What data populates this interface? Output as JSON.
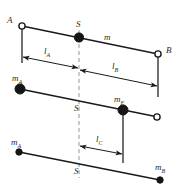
{
  "figure": {
    "width": 179,
    "height": 186,
    "background": "#ffffff",
    "line_color": "#1a1a1a",
    "centerline_color": "#8a8a8a",
    "node_fill_color": "#151515"
  },
  "bars": [
    {
      "id": "bar-top",
      "name": "original-rod",
      "left_label": "A",
      "right_label": "B",
      "center_label": "S",
      "mass_label": "m",
      "left_node": "open",
      "right_node": "open",
      "center_node": "filled"
    },
    {
      "id": "bar-middle",
      "name": "two-mass-equivalent-rod",
      "left_label": "m",
      "left_sub": "A",
      "right_label": "m",
      "right_sub": "E",
      "center_label": "S",
      "left_node": "filled",
      "right_node": "filled",
      "end_node": "open"
    },
    {
      "id": "bar-bottom",
      "name": "reduced-mass-rod",
      "left_label": "m",
      "left_sub": "A",
      "right_label": "m",
      "right_sub": "B",
      "center_label": "S",
      "left_node": "filled-small",
      "right_node": "filled-small"
    }
  ],
  "dimensions": [
    {
      "id": "dim-la",
      "name": "distance-a-to-s",
      "symbol": "l",
      "subscript": "A",
      "from": "A",
      "to": "S"
    },
    {
      "id": "dim-lb",
      "name": "distance-s-to-b",
      "symbol": "l",
      "subscript": "B",
      "from": "S",
      "to": "B"
    },
    {
      "id": "dim-lc",
      "name": "distance-s-to-me",
      "symbol": "l",
      "subscript": "C",
      "from": "S",
      "to": "mE"
    }
  ],
  "labels": {
    "a_point": "A",
    "b_point": "B",
    "s_top": "S",
    "s_middle": "S",
    "s_bottom": "S",
    "mass_m": "m",
    "mass_ma_mid": "m",
    "mass_ma_mid_sub": "A",
    "mass_me": "m",
    "mass_me_sub": "E",
    "mass_ma_bot": "m",
    "mass_ma_bot_sub": "A",
    "mass_mb_bot": "m",
    "mass_mb_bot_sub": "B",
    "l_a": "l",
    "l_a_sub": "A",
    "l_b": "l",
    "l_b_sub": "B",
    "l_c": "l",
    "l_c_sub": "C"
  }
}
